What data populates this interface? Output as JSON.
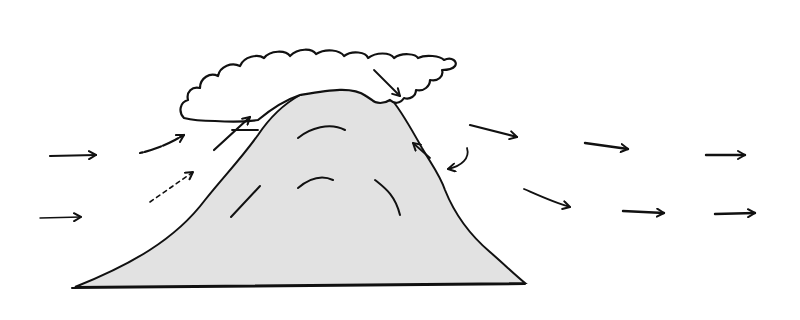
{
  "diagram": {
    "title": "Orographic airflow over a mountain with cap cloud",
    "colors": {
      "ink": "#111111",
      "mountain_fill": "#e2e2e2",
      "cloud_fill": "#ffffff",
      "background": "#ffffff"
    },
    "elements": {
      "mountain": "mountain",
      "cloud": "cap-cloud",
      "windward_arrows": [
        "incoming-wind-upper",
        "incoming-wind-lower",
        "rising-air-upper",
        "rising-air-lower",
        "updraft-into-cloud"
      ],
      "lee_arrows": [
        "downdraft-from-cloud",
        "lee-eddy-up",
        "lee-eddy-curl",
        "lee-wind-upper",
        "lee-wind-lower"
      ],
      "downstream_arrows": [
        "downstream-wind-upper-1",
        "downstream-wind-upper-2",
        "downstream-wind-lower-1",
        "downstream-wind-lower-2"
      ]
    }
  }
}
